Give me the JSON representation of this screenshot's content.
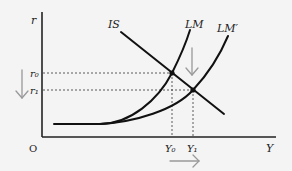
{
  "diagram": {
    "type": "IS-LM",
    "axes": {
      "y_label": "r",
      "x_label": "Y",
      "origin_label": "O"
    },
    "curves": {
      "is_label": "IS",
      "lm_label": "LM",
      "lm_prime_label": "LM′"
    },
    "levels": {
      "r0": "r₀",
      "r1": "r₁",
      "y0": "Y₀",
      "y1": "Y₁"
    },
    "colors": {
      "curve": "#111111",
      "axis": "#222222",
      "guide": "#333333",
      "arrow": "#999999"
    }
  }
}
